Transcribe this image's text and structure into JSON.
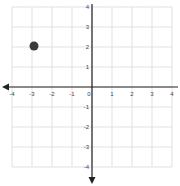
{
  "chart_data": {
    "type": "scatter",
    "title": "",
    "xlabel": "",
    "ylabel": "",
    "xlim": [
      -4,
      4
    ],
    "ylim": [
      -4,
      4
    ],
    "grid": true,
    "x_ticks": [
      -4,
      -3,
      -2,
      -1,
      0,
      1,
      2,
      3,
      4
    ],
    "y_ticks": [
      4,
      3,
      2,
      1,
      -1,
      -2,
      -3,
      -4
    ],
    "series": [
      {
        "name": "point",
        "points": [
          {
            "x": -3,
            "y": 2
          }
        ],
        "color": "#3a3a3a"
      }
    ],
    "axis_arrows": {
      "x_negative": true,
      "y_negative": true
    }
  },
  "colors": {
    "grid": "#d9d9d9",
    "axis": "#222222",
    "point": "#3a3a3a"
  }
}
